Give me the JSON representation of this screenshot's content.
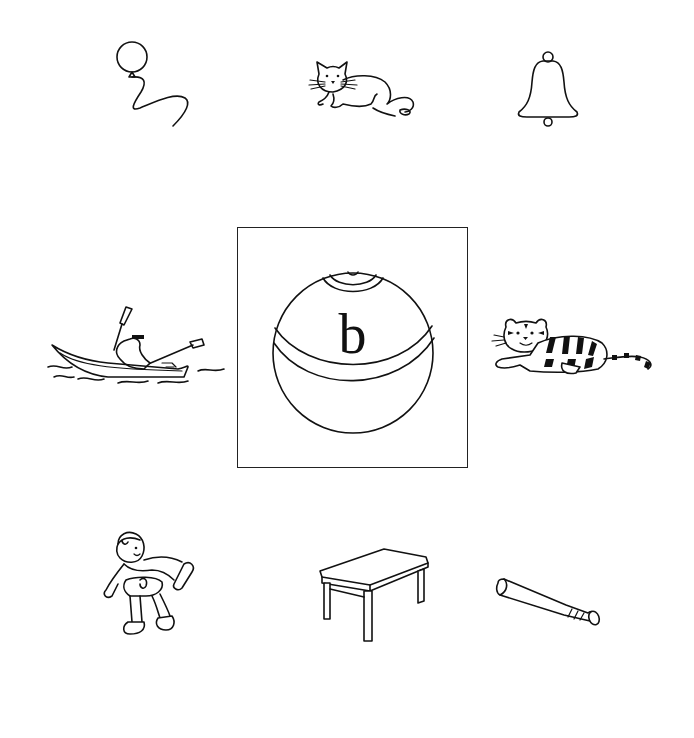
{
  "worksheet": {
    "center": {
      "letter": "b",
      "picture": "ball"
    },
    "pictures": [
      {
        "position": "top-left",
        "name": "balloon"
      },
      {
        "position": "top-center",
        "name": "cat"
      },
      {
        "position": "top-right",
        "name": "bell"
      },
      {
        "position": "middle-left",
        "name": "boat"
      },
      {
        "position": "middle-right",
        "name": "tiger"
      },
      {
        "position": "bottom-left",
        "name": "boy"
      },
      {
        "position": "bottom-center",
        "name": "table"
      },
      {
        "position": "bottom-right",
        "name": "bat"
      }
    ],
    "colors": {
      "ink": "#111111",
      "paper": "#ffffff"
    }
  }
}
